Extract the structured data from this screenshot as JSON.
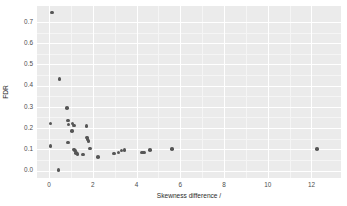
{
  "chart_data": {
    "type": "scatter",
    "title": "",
    "xlabel": "Skewness difference /",
    "ylabel": "FDR",
    "xlim": [
      -0.55,
      13.35
    ],
    "ylim": [
      -0.035,
      0.775
    ],
    "grid": true,
    "legend": null,
    "xticks": [
      0,
      2,
      4,
      6,
      8,
      10,
      12
    ],
    "xtick_labels": [
      "0",
      "2",
      "4",
      "6",
      "8",
      "10",
      "12"
    ],
    "yticks": [
      0.0,
      0.1,
      0.2,
      0.3,
      0.4,
      0.5,
      0.6,
      0.7
    ],
    "ytick_labels": [
      "0.0",
      "0.1",
      "0.2",
      "0.3",
      "0.4",
      "0.5",
      "0.6",
      "0.7"
    ],
    "x_minor_ticks": [
      1,
      3,
      5,
      7,
      9,
      11
    ],
    "y_minor_ticks": [
      0.05,
      0.15,
      0.25,
      0.35,
      0.45,
      0.55,
      0.65
    ],
    "marker": "circle",
    "marker_color": "#565656",
    "marker_size": 3.6,
    "panel_background": "#ebebeb",
    "gridline_color": "#ffffff",
    "points": [
      {
        "x": 0.14,
        "y": 0.745
      },
      {
        "x": 0.47,
        "y": 0.432
      },
      {
        "x": 0.83,
        "y": 0.295
      },
      {
        "x": 0.07,
        "y": 0.221
      },
      {
        "x": 0.86,
        "y": 0.236
      },
      {
        "x": 0.89,
        "y": 0.216
      },
      {
        "x": 1.08,
        "y": 0.221
      },
      {
        "x": 1.14,
        "y": 0.213
      },
      {
        "x": 1.72,
        "y": 0.209
      },
      {
        "x": 1.05,
        "y": 0.186
      },
      {
        "x": 1.73,
        "y": 0.156
      },
      {
        "x": 1.76,
        "y": 0.148
      },
      {
        "x": 1.8,
        "y": 0.14
      },
      {
        "x": 0.86,
        "y": 0.133
      },
      {
        "x": 0.06,
        "y": 0.117
      },
      {
        "x": 1.88,
        "y": 0.104
      },
      {
        "x": 1.14,
        "y": 0.099
      },
      {
        "x": 1.18,
        "y": 0.095
      },
      {
        "x": 3.32,
        "y": 0.094
      },
      {
        "x": 3.46,
        "y": 0.096
      },
      {
        "x": 4.63,
        "y": 0.097
      },
      {
        "x": 5.62,
        "y": 0.101
      },
      {
        "x": 12.24,
        "y": 0.101
      },
      {
        "x": 1.24,
        "y": 0.082
      },
      {
        "x": 1.3,
        "y": 0.078
      },
      {
        "x": 1.55,
        "y": 0.076
      },
      {
        "x": 2.98,
        "y": 0.081
      },
      {
        "x": 3.18,
        "y": 0.086
      },
      {
        "x": 4.26,
        "y": 0.085
      },
      {
        "x": 4.35,
        "y": 0.085
      },
      {
        "x": 2.23,
        "y": 0.065
      },
      {
        "x": 0.44,
        "y": 0.002
      }
    ]
  }
}
